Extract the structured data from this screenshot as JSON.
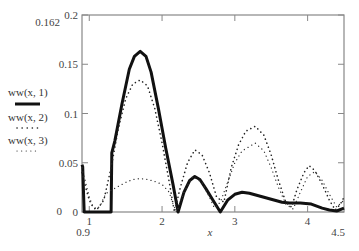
{
  "chart_data": {
    "type": "line",
    "title": "",
    "xlabel": "x",
    "ylabel": "",
    "xlim": [
      0.9,
      4.5
    ],
    "ylim": [
      0,
      0.2
    ],
    "grid": false,
    "legend_position": "left",
    "x_ticks": [
      1,
      2,
      3,
      4
    ],
    "x_tick_labels": [
      "1",
      "2",
      "3",
      "4"
    ],
    "x_range_labels": {
      "min": "0.9",
      "max": "4.5"
    },
    "y_ticks": [
      0,
      0.05,
      0.1,
      0.15,
      0.2
    ],
    "y_tick_labels": [
      "0",
      "0.05",
      "0.1",
      "0.15",
      "0.2"
    ],
    "y_range_labels": {
      "min": "0",
      "max": "0.162"
    },
    "series": [
      {
        "name": "ww(x, 1)",
        "style": "solid-thick",
        "x": [
          0.9,
          0.91,
          0.92,
          0.93,
          1.3,
          1.31,
          1.35,
          1.45,
          1.55,
          1.62,
          1.7,
          1.78,
          1.85,
          1.95,
          2.05,
          2.15,
          2.22,
          2.3,
          2.38,
          2.45,
          2.52,
          2.6,
          2.7,
          2.8,
          2.9,
          3.0,
          3.1,
          3.2,
          3.35,
          3.5,
          3.65,
          3.75,
          3.9,
          4.05,
          4.2,
          4.3,
          4.4,
          4.5
        ],
        "y": [
          0.048,
          0.046,
          0.02,
          0.0,
          0.0,
          0.06,
          0.072,
          0.11,
          0.145,
          0.158,
          0.163,
          0.158,
          0.142,
          0.105,
          0.065,
          0.028,
          0.0,
          0.02,
          0.032,
          0.036,
          0.033,
          0.024,
          0.012,
          0.0,
          0.012,
          0.018,
          0.02,
          0.019,
          0.016,
          0.013,
          0.01,
          0.009,
          0.009,
          0.008,
          0.004,
          0.002,
          0.001,
          0.004
        ]
      },
      {
        "name": "ww(x, 2)",
        "style": "dotted-bold",
        "x": [
          0.9,
          0.95,
          1.0,
          1.05,
          1.1,
          1.2,
          1.3,
          1.4,
          1.5,
          1.6,
          1.7,
          1.8,
          1.9,
          2.0,
          2.1,
          2.17,
          2.25,
          2.35,
          2.45,
          2.55,
          2.65,
          2.75,
          2.85,
          2.95,
          3.05,
          3.15,
          3.28,
          3.4,
          3.5,
          3.6,
          3.7,
          3.78,
          3.85,
          3.95,
          4.02,
          4.1,
          4.2,
          4.3,
          4.38,
          4.45,
          4.5
        ],
        "y": [
          0.04,
          0.025,
          0.012,
          0.005,
          0.002,
          0.012,
          0.045,
          0.085,
          0.115,
          0.13,
          0.134,
          0.128,
          0.105,
          0.07,
          0.03,
          0.0,
          0.025,
          0.05,
          0.063,
          0.058,
          0.04,
          0.015,
          0.01,
          0.045,
          0.068,
          0.082,
          0.087,
          0.078,
          0.058,
          0.032,
          0.01,
          0.005,
          0.022,
          0.04,
          0.047,
          0.042,
          0.028,
          0.012,
          0.002,
          0.008,
          0.015
        ]
      },
      {
        "name": "ww(x, 3)",
        "style": "dotted-light",
        "x": [
          0.9,
          0.95,
          1.0,
          1.05,
          1.1,
          1.15,
          1.2,
          1.25,
          1.3,
          1.4,
          1.5,
          1.6,
          1.7,
          1.8,
          1.9,
          2.0,
          2.1,
          2.15,
          2.2,
          2.3,
          2.42,
          2.55,
          2.65,
          2.72,
          2.8,
          2.9,
          3.0,
          3.1,
          3.28,
          3.4,
          3.5,
          3.6,
          3.7,
          3.8,
          3.9,
          4.0,
          4.1,
          4.2,
          4.3,
          4.4,
          4.5
        ],
        "y": [
          0.045,
          0.03,
          0.015,
          0.006,
          0.003,
          0.006,
          0.015,
          0.02,
          0.022,
          0.026,
          0.03,
          0.033,
          0.034,
          0.033,
          0.031,
          0.028,
          0.02,
          0.008,
          0.0,
          0.02,
          0.036,
          0.03,
          0.015,
          0.004,
          0.01,
          0.03,
          0.05,
          0.062,
          0.07,
          0.062,
          0.045,
          0.025,
          0.008,
          0.003,
          0.02,
          0.036,
          0.041,
          0.032,
          0.018,
          0.005,
          0.012
        ]
      }
    ]
  },
  "legend": {
    "items": [
      {
        "label": "ww(x, 1)"
      },
      {
        "label": "ww(x, 2)"
      },
      {
        "label": "ww(x, 3)"
      }
    ]
  },
  "colors": {
    "frame": "#888888",
    "line": "#111111",
    "text": "#444444"
  }
}
